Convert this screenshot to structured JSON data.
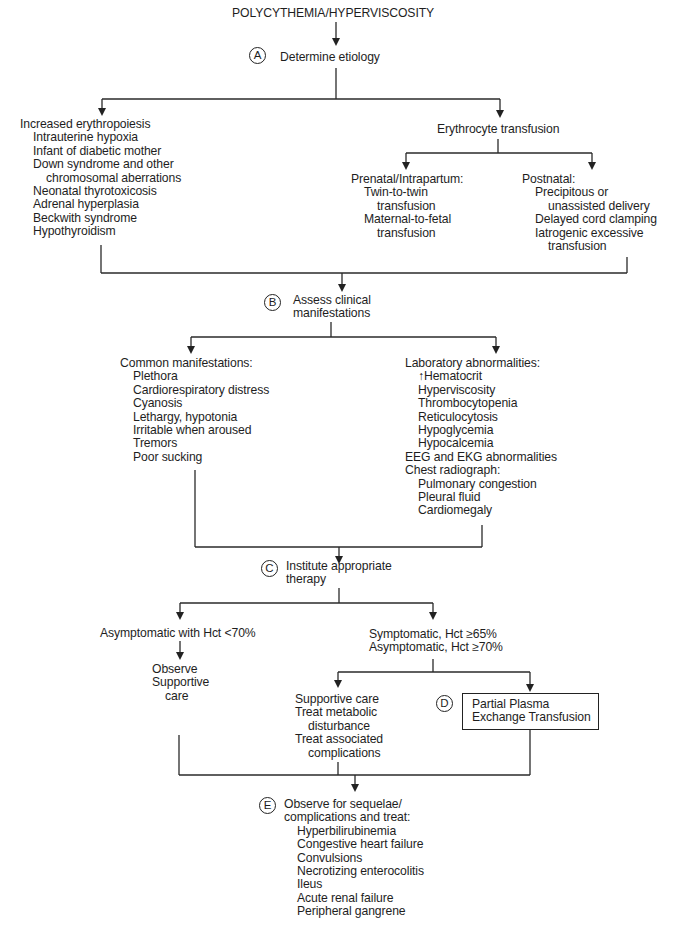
{
  "title": "POLYCYTHEMIA/HYPERVISCOSITY",
  "steps": {
    "A": {
      "marker": "A",
      "label": "Determine etiology"
    },
    "B": {
      "marker": "B",
      "label_lines": [
        "Assess clinical",
        "manifestations"
      ]
    },
    "C": {
      "marker": "C",
      "label_lines": [
        "Institute appropriate",
        "therapy"
      ]
    },
    "D": {
      "marker": "D",
      "label_lines": [
        "Partial Plasma",
        "Exchange Transfusion"
      ]
    },
    "E": {
      "marker": "E",
      "label_lines": [
        "Observe for sequelae/",
        "complications and treat:"
      ],
      "items": [
        "Hyperbilirubinemia",
        "Congestive heart failure",
        "Convulsions",
        "Necrotizing enterocolitis",
        "Ileus",
        "Acute renal failure",
        "Peripheral gangrene"
      ]
    }
  },
  "etiology": {
    "increased_erythropoiesis": {
      "heading": "Increased erythropoiesis",
      "items": [
        "Intrauterine hypoxia",
        "Infant of diabetic mother",
        "Down syndrome and other",
        "chromosomal aberrations",
        "Neonatal thyrotoxicosis",
        "Adrenal hyperplasia",
        "Beckwith syndrome",
        "Hypothyroidism"
      ]
    },
    "erythrocyte_transfusion": {
      "heading": "Erythrocyte transfusion",
      "prenatal": {
        "heading": "Prenatal/Intrapartum:",
        "items": [
          "Twin-to-twin",
          "transfusion",
          "Maternal-to-fetal",
          "transfusion"
        ]
      },
      "postnatal": {
        "heading": "Postnatal:",
        "items": [
          "Precipitous or",
          "unassisted delivery",
          "Delayed cord clamping",
          "Iatrogenic excessive",
          "transfusion"
        ]
      }
    }
  },
  "manifestations": {
    "common": {
      "heading": "Common manifestations:",
      "items": [
        "Plethora",
        "Cardiorespiratory distress",
        "Cyanosis",
        "Lethargy, hypotonia",
        "Irritable when aroused",
        "Tremors",
        "Poor sucking"
      ]
    },
    "laboratory": {
      "heading": "Laboratory abnormalities:",
      "items": [
        "↑Hematocrit",
        "Hyperviscosity",
        "Thrombocytopenia",
        "Reticulocytosis",
        "Hypoglycemia",
        "Hypocalcemia"
      ],
      "eeg": "EEG and EKG abnormalities",
      "chest_heading": "Chest radiograph:",
      "chest_items": [
        "Pulmonary congestion",
        "Pleural fluid",
        "Cardiomegaly"
      ]
    }
  },
  "therapy": {
    "asymptomatic": {
      "condition": "Asymptomatic with Hct <70%",
      "actions": [
        "Observe",
        "Supportive",
        "care"
      ]
    },
    "symptomatic": {
      "condition_lines": [
        "Symptomatic, Hct ≥65%",
        "Asymptomatic, Hct ≥70%"
      ],
      "actions": [
        "Supportive care",
        "Treat metabolic",
        "disturbance",
        "Treat associated",
        "complications"
      ]
    }
  }
}
